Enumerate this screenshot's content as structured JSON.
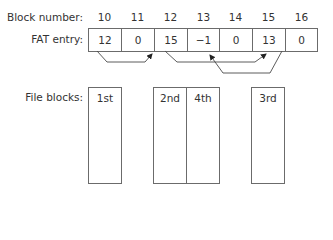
{
  "labels": {
    "block_number": "Block number:",
    "fat_entry": "FAT entry:",
    "file_blocks": "File blocks:"
  },
  "block_numbers": [
    "10",
    "11",
    "12",
    "13",
    "14",
    "15",
    "16"
  ],
  "fat_entries": [
    "12",
    "0",
    "15",
    "−1",
    "0",
    "13",
    "0"
  ],
  "file_blocks": [
    {
      "label": "1st",
      "block": "10"
    },
    {
      "label": "2nd",
      "block": "12"
    },
    {
      "label": "4th",
      "block": "13"
    },
    {
      "label": "3rd",
      "block": "15"
    }
  ],
  "chain": [
    {
      "from": "10",
      "to": "12"
    },
    {
      "from": "12",
      "to": "15"
    },
    {
      "from": "15",
      "to": "13"
    }
  ],
  "colors": {
    "line": "#4a4a4a",
    "border": "#6b6b6b",
    "text": "#333333"
  }
}
